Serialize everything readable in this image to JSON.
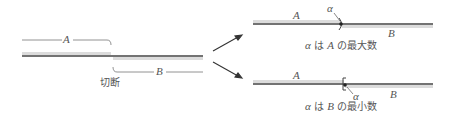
{
  "diagram": {
    "left": {
      "label_a": "A",
      "label_b": "B",
      "cut_label": "切断"
    },
    "top_right": {
      "label_a": "A",
      "label_b": "B",
      "point_label": "α",
      "caption_var": "α",
      "caption_mid": " は ",
      "caption_set": "A",
      "caption_end": " の最大数"
    },
    "bottom_right": {
      "label_a": "A",
      "label_b": "B",
      "point_label": "α",
      "caption_var": "α",
      "caption_mid": " は ",
      "caption_set": "B",
      "caption_end": " の最小数"
    },
    "colors": {
      "line": "#444444",
      "shade": "#d8d8d8",
      "text": "#555555"
    }
  }
}
